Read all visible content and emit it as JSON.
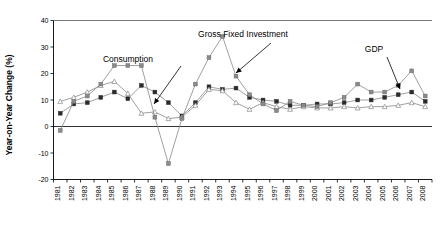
{
  "chart_data": {
    "type": "line",
    "title": "",
    "xlabel": "",
    "ylabel": "Year-on-Year Change (%)",
    "ylim": [
      -20,
      40
    ],
    "yticks": [
      -20,
      -10,
      0,
      10,
      20,
      30,
      40
    ],
    "ytick_labels": [
      "-20",
      "-10",
      "0",
      "10",
      "20",
      "30",
      "40"
    ],
    "grid": false,
    "legend_position": "annotations-inline",
    "categories": [
      "1981",
      "1982",
      "1983",
      "1984",
      "1985",
      "1986",
      "1987",
      "1988",
      "1989",
      "1990",
      "1991",
      "1992",
      "1993",
      "1994",
      "1995",
      "1996",
      "1997",
      "1998",
      "1999",
      "2000",
      "2001",
      "2002",
      "2003",
      "2004",
      "2005",
      "2006",
      "2007",
      "2008"
    ],
    "series": [
      {
        "name": "GDP",
        "marker": "filled-square",
        "color": "#444444",
        "values": [
          5.0,
          8.5,
          9.0,
          11.0,
          13.0,
          10.5,
          15.5,
          13.0,
          9.0,
          4.0,
          9.0,
          15.0,
          14.0,
          14.5,
          11.0,
          10.0,
          9.5,
          8.0,
          8.0,
          8.5,
          8.5,
          9.0,
          10.0,
          10.0,
          11.0,
          12.0,
          13.0,
          9.5
        ]
      },
      {
        "name": "Consumption",
        "marker": "open-triangle",
        "color": "#888888",
        "values": [
          9.5,
          11.0,
          13.0,
          15.5,
          17.0,
          12.5,
          5.0,
          5.5,
          3.0,
          3.5,
          8.0,
          14.0,
          13.5,
          9.0,
          6.5,
          9.0,
          7.5,
          6.5,
          7.5,
          7.0,
          7.0,
          7.5,
          7.0,
          7.5,
          7.5,
          8.0,
          9.0,
          7.5
        ]
      },
      {
        "name": "Gross Fixed Investment",
        "marker": "filled-square-light",
        "color": "#777777",
        "values": [
          -1.5,
          9.5,
          11.5,
          16.0,
          23.0,
          23.0,
          23.0,
          3.5,
          -14.0,
          3.0,
          16.0,
          26.0,
          34.0,
          19.0,
          12.0,
          8.5,
          6.0,
          9.5,
          8.0,
          7.5,
          9.0,
          11.0,
          16.0,
          13.0,
          13.0,
          15.5,
          21.0,
          11.5
        ]
      }
    ],
    "annotations": [
      {
        "id": "consumption",
        "label": "Consumption",
        "text_x": 128,
        "text_y": 62,
        "arrow_from_x": 181,
        "arrow_from_y": 66,
        "arrow_to_x": 154,
        "arrow_to_y": 104
      },
      {
        "id": "gross-fixed-investment",
        "label": "Gross Fixed Investment",
        "text_x": 243,
        "text_y": 37,
        "arrow_from_x": 271,
        "arrow_from_y": 43,
        "arrow_to_x": 236,
        "arrow_to_y": 73
      },
      {
        "id": "gdp",
        "label": "GDP",
        "text_x": 374,
        "text_y": 52,
        "arrow_from_x": 387,
        "arrow_from_y": 57,
        "arrow_to_x": 400,
        "arrow_to_y": 89
      }
    ]
  }
}
